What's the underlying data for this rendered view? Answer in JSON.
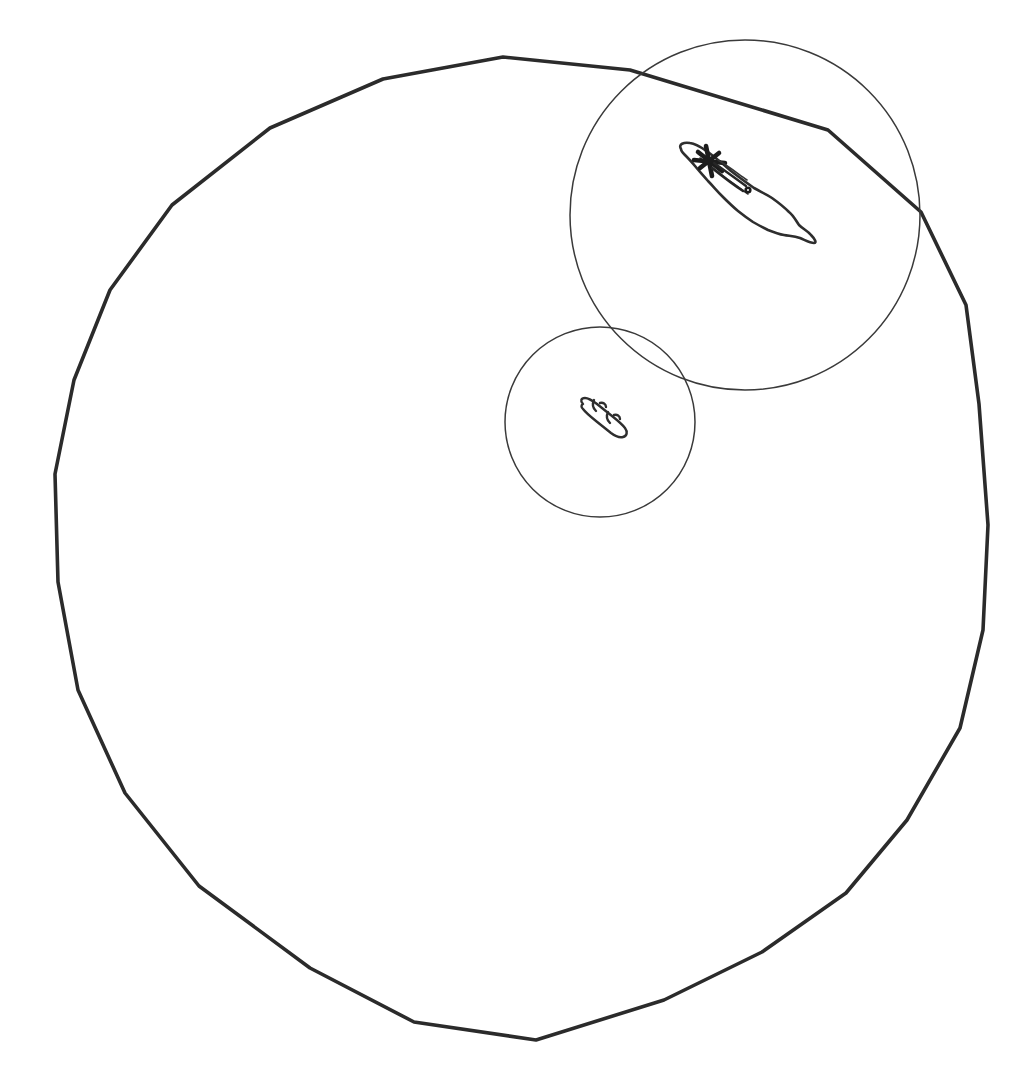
{
  "canvas": {
    "width": 1015,
    "height": 1073,
    "background_color": "#ffffff",
    "description": "Hand-drawn line sketch on plain white background"
  },
  "palette": {
    "outer_boundary_stroke": "#2b2b2b",
    "thin_circle_stroke": "#3a3a3a",
    "blob_outline_stroke": "#2e2e2e",
    "heavy_mark_stroke": "#1c1c1c"
  },
  "shapes": {
    "outer_boundary": {
      "name": "outer-polygon-boundary",
      "kind": "polygon",
      "stroke_width": 3.6,
      "closed": true,
      "vertex_count": 19,
      "bounds": {
        "x_min": 52,
        "y_min": 57,
        "x_max": 990,
        "y_max": 1040
      },
      "approx_center": [
        520,
        550
      ],
      "approx_radius": 470,
      "points": [
        [
          503,
          57
        ],
        [
          630,
          70
        ],
        [
          828,
          130
        ],
        [
          921,
          212
        ],
        [
          966,
          305
        ],
        [
          979,
          404
        ],
        [
          988,
          525
        ],
        [
          983,
          630
        ],
        [
          960,
          728
        ],
        [
          907,
          820
        ],
        [
          846,
          893
        ],
        [
          762,
          952
        ],
        [
          664,
          1000
        ],
        [
          536,
          1040
        ],
        [
          414,
          1022
        ],
        [
          310,
          968
        ],
        [
          199,
          886
        ],
        [
          125,
          793
        ],
        [
          78,
          690
        ],
        [
          58,
          582
        ],
        [
          55,
          474
        ],
        [
          74,
          380
        ],
        [
          110,
          290
        ],
        [
          172,
          205
        ],
        [
          270,
          128
        ],
        [
          383,
          79
        ]
      ]
    },
    "medium_circle": {
      "name": "medium-circle",
      "kind": "circle",
      "stroke_width": 1.5,
      "center": [
        745,
        215
      ],
      "radius": 175,
      "bounds": {
        "x_min": 570,
        "y_min": 40,
        "x_max": 920,
        "y_max": 390
      }
    },
    "small_circle": {
      "name": "small-circle",
      "kind": "circle",
      "stroke_width": 1.5,
      "center": [
        600,
        422
      ],
      "radius": 95,
      "bounds": {
        "x_min": 505,
        "y_min": 327,
        "x_max": 695,
        "y_max": 517
      }
    },
    "large_blob": {
      "name": "elongated-teardrop-blob",
      "kind": "freeform-outline",
      "stroke_width": 2.6,
      "location": "inside medium circle, upper right region",
      "bounds": {
        "x_min": 676,
        "y_min": 142,
        "x_max": 818,
        "y_max": 243
      },
      "orientation": "diagonal, narrow end upper-left, bulbous end lower-right",
      "has_heavy_cross_mark": true,
      "cross_mark_position": [
        709,
        160
      ]
    },
    "small_blob": {
      "name": "segmented-capsule-blob",
      "kind": "freeform-outline",
      "stroke_width": 2.4,
      "location": "inside small circle, center region",
      "bounds": {
        "x_min": 577,
        "y_min": 398,
        "x_max": 626,
        "y_max": 438
      },
      "orientation": "diagonal, upper-left to lower-right",
      "segment_count": 3
    }
  },
  "layers": [
    {
      "label": "outer-polygon-boundary",
      "z": 1
    },
    {
      "label": "medium-circle",
      "z": 2
    },
    {
      "label": "small-circle",
      "z": 3
    },
    {
      "label": "elongated-teardrop-blob",
      "z": 4
    },
    {
      "label": "segmented-capsule-blob",
      "z": 5
    }
  ]
}
